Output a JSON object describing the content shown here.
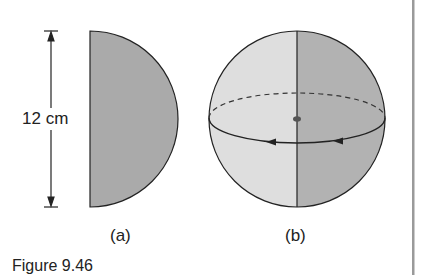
{
  "figure": {
    "caption": "Figure 9.46",
    "panel_a": {
      "label": "(a)",
      "dimension_label": "12 cm",
      "shape": "semicircle",
      "fill": "#aaaaaa"
    },
    "panel_b": {
      "label": "(b)",
      "shape": "sphere-of-revolution",
      "left_fill": "#dedede",
      "right_fill": "#b2b2b2"
    },
    "stroke_color": "#222222",
    "margin_rule_color": "#9a9a9a"
  }
}
